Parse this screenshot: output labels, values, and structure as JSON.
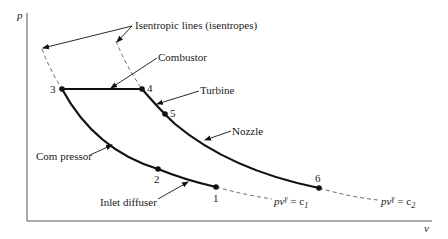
{
  "diagram": {
    "axes": {
      "y_label": "p",
      "x_label": "v"
    },
    "points": [
      {
        "id": "1",
        "label": "1"
      },
      {
        "id": "2",
        "label": "2"
      },
      {
        "id": "3",
        "label": "3"
      },
      {
        "id": "4",
        "label": "4"
      },
      {
        "id": "5",
        "label": "5"
      },
      {
        "id": "6",
        "label": "6"
      }
    ],
    "labels": {
      "isentropes": "Isentropic lines (isentropes)",
      "combustor": "Combustor",
      "turbine": "Turbine",
      "nozzle": "Nozzle",
      "compressor": "Com pressor",
      "inlet_diffuser": "Inlet diffuser"
    },
    "equations": {
      "c1": {
        "lhs": "pv",
        "exp": "γ",
        "rhs": " = c",
        "sub": "1"
      },
      "c2": {
        "lhs": "pv",
        "exp": "γ",
        "rhs": " = c",
        "sub": "2"
      }
    },
    "colors": {
      "line": "#111111",
      "axis": "#555555",
      "dashed": "#444444"
    }
  }
}
